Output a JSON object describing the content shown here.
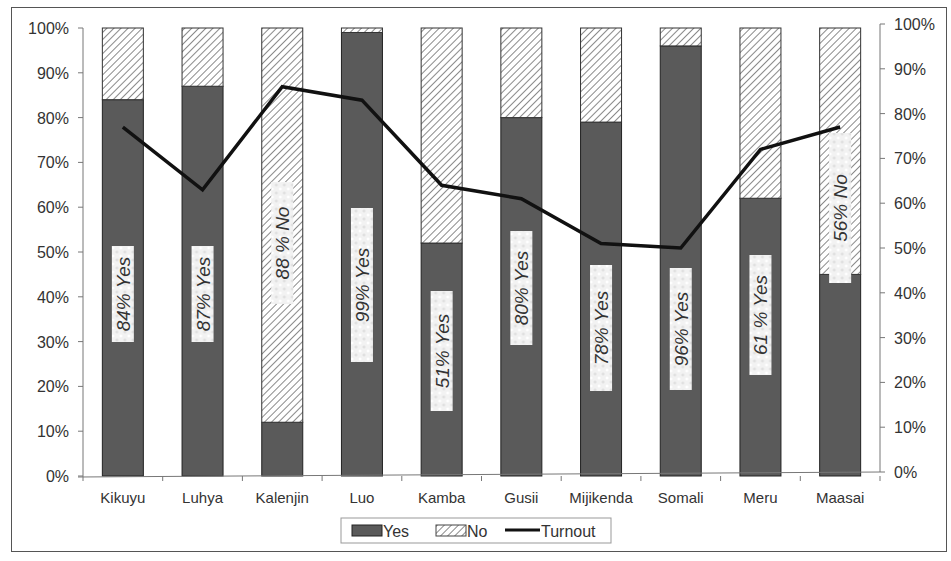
{
  "chart_data": {
    "type": "bar",
    "subtype": "stacked-100-percent-with-line",
    "title": "",
    "xlabel": "",
    "ylabel": "",
    "y2label": "",
    "categories": [
      "Kikuyu",
      "Luhya",
      "Kalenjin",
      "Luo",
      "Kamba",
      "Gusii",
      "Mijikenda",
      "Somali",
      "Meru",
      "Maasai"
    ],
    "series": [
      {
        "name": "Yes",
        "type": "bar",
        "axis": "left",
        "color": "#5a5a5a",
        "values": [
          84,
          87,
          12,
          99,
          52,
          80,
          79,
          96,
          62,
          45
        ]
      },
      {
        "name": "No",
        "type": "bar",
        "axis": "left",
        "pattern": "diagonal-hatch",
        "color": "#c8c8c8",
        "values": [
          16,
          13,
          88,
          1,
          48,
          20,
          21,
          4,
          38,
          55
        ]
      },
      {
        "name": "Turnout",
        "type": "line",
        "axis": "right",
        "color": "#111111",
        "values": [
          77,
          63,
          86,
          83,
          64,
          61,
          51,
          50,
          72,
          77
        ]
      }
    ],
    "bar_annotations": [
      "84% Yes",
      "87% Yes",
      "88 % No",
      "99% Yes",
      "51% Yes",
      "80% Yes",
      "78% Yes",
      "96% Yes",
      "61 % Yes",
      "56% No"
    ],
    "ylim": [
      0,
      100
    ],
    "y2lim": [
      0,
      100
    ],
    "yticks": [
      "0%",
      "10%",
      "20%",
      "30%",
      "40%",
      "50%",
      "60%",
      "70%",
      "80%",
      "90%",
      "100%"
    ],
    "y2ticks": [
      "0%",
      "10%",
      "20%",
      "30%",
      "40%",
      "50%",
      "60%",
      "70%",
      "80%",
      "90%",
      "100%"
    ],
    "grid": false,
    "legend": {
      "position": "bottom",
      "entries": [
        "Yes",
        "No",
        "Turnout"
      ]
    }
  },
  "layout": {
    "annotation_centers_y": [
      294,
      294,
      243,
      285,
      351,
      288,
      328,
      329,
      315,
      208
    ],
    "annotation_box_len": [
      96,
      96,
      122,
      154,
      120,
      114,
      126,
      122,
      120,
      150
    ]
  }
}
